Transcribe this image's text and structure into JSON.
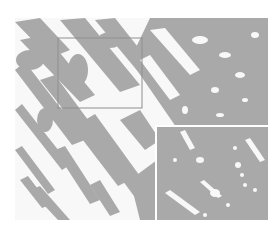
{
  "figure": {
    "colors": {
      "background": "#ffffff",
      "gray": "#a9a9a9",
      "white": "#f8f8f8",
      "outline": "#8f8f8f",
      "inset_border": "#ffffff"
    },
    "main_image": {
      "x": 15,
      "y": 18,
      "width": 253,
      "height": 202
    },
    "highlight_rect": {
      "x": 58,
      "y": 38,
      "width": 84,
      "height": 70
    },
    "inset": {
      "x": 157,
      "y": 127,
      "width": 111,
      "height": 93
    }
  }
}
